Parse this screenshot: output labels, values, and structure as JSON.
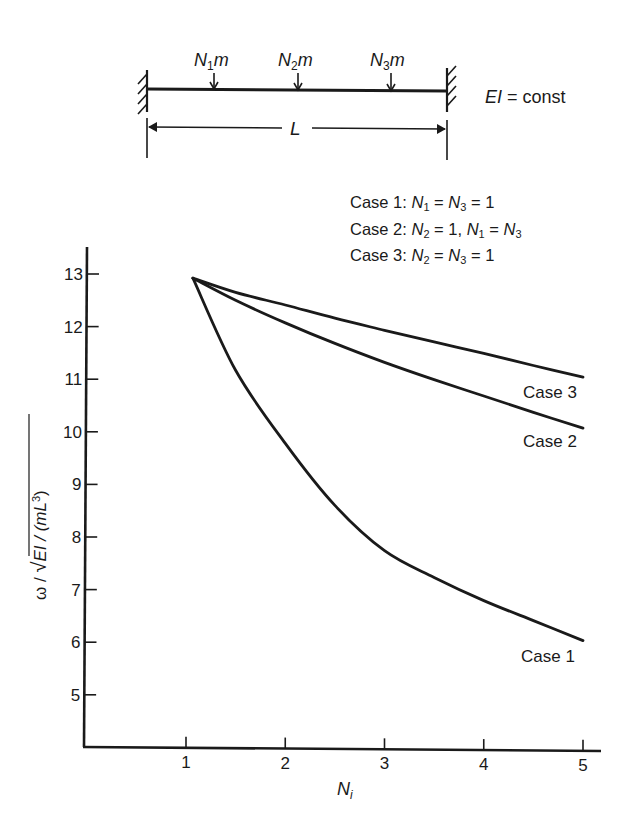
{
  "diagram": {
    "mass_labels": [
      {
        "N": "N",
        "sub": "1",
        "m": "m"
      },
      {
        "N": "N",
        "sub": "2",
        "m": "m"
      },
      {
        "N": "N",
        "sub": "3",
        "m": "m"
      }
    ],
    "length_label": "L",
    "stiffness_label_ei": "EI",
    "stiffness_label_rest": " = const"
  },
  "legend": {
    "lines": [
      {
        "prefix": "Case 1: ",
        "parts": [
          [
            "N",
            "1",
            " = "
          ],
          [
            "N",
            "3",
            " = 1"
          ]
        ]
      },
      {
        "prefix": "Case 2: ",
        "parts": [
          [
            "N",
            "2",
            " = 1, "
          ],
          [
            "N",
            "1",
            " = "
          ],
          [
            "N",
            "3",
            ""
          ]
        ]
      },
      {
        "prefix": "Case 3: ",
        "parts": [
          [
            "N",
            "2",
            " = "
          ],
          [
            "N",
            "3",
            " = 1"
          ]
        ]
      }
    ]
  },
  "axes": {
    "x_label_main": "N",
    "x_label_sub": "i",
    "y_label_omega": "ω / ",
    "y_label_rad": "EI / (mL",
    "y_label_exp": "3",
    "y_label_close": ")"
  },
  "chart_data": {
    "type": "line",
    "title": "",
    "xlabel": "N_i",
    "ylabel": "ω / sqrt(EI / (mL^3))",
    "xlim": [
      0,
      5.2
    ],
    "ylim": [
      4,
      13.5
    ],
    "x_ticks": [
      1,
      2,
      3,
      4,
      5
    ],
    "y_ticks": [
      5,
      6,
      7,
      8,
      9,
      10,
      11,
      12,
      13
    ],
    "grid": false,
    "legend_position": "top-right (text annotations)",
    "annotations": [
      "Case 1: N1 = N3 = 1",
      "Case 2: N2 = 1, N1 = N3",
      "Case 3: N2 = N3 = 1",
      "EI = const"
    ],
    "series": [
      {
        "name": "Case 1",
        "x": [
          1.07,
          1.5,
          2,
          2.5,
          3,
          3.5,
          4,
          4.5,
          5
        ],
        "y": [
          12.92,
          11.17,
          9.78,
          8.6,
          7.74,
          7.23,
          6.79,
          6.41,
          6.03
        ]
      },
      {
        "name": "Case 2",
        "x": [
          1.07,
          1.5,
          2,
          2.5,
          3,
          3.5,
          4,
          4.5,
          5
        ],
        "y": [
          12.92,
          12.5,
          12.07,
          11.68,
          11.32,
          10.99,
          10.68,
          10.37,
          10.07
        ]
      },
      {
        "name": "Case 3",
        "x": [
          1.07,
          1.5,
          2,
          2.5,
          3,
          3.5,
          4,
          4.5,
          5
        ],
        "y": [
          12.92,
          12.65,
          12.41,
          12.16,
          11.93,
          11.71,
          11.49,
          11.26,
          11.04
        ]
      }
    ]
  }
}
